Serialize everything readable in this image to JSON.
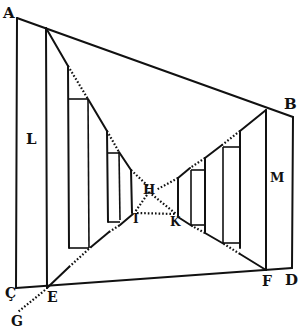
{
  "diagram": {
    "type": "perspective-construction",
    "labels": {
      "A": "A",
      "B": "B",
      "C": "Ç",
      "D": "D",
      "E": "E",
      "F": "F",
      "G": "G",
      "H": "H",
      "I": "I",
      "K": "K",
      "L": "L",
      "M": "M"
    },
    "stroke_color": "#111111",
    "background_color": "#ffffff"
  }
}
